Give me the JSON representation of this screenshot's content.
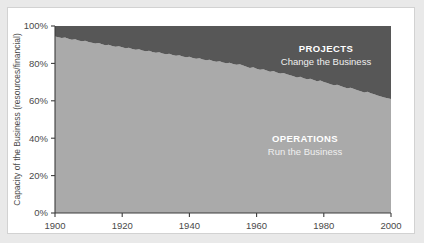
{
  "chart_data": {
    "type": "area",
    "stacked": true,
    "title": "",
    "xlabel": "",
    "ylabel": "Capacity of the Business (resources/financial)",
    "xlim": [
      1900,
      2000
    ],
    "ylim": [
      0,
      100
    ],
    "grid": false,
    "legend_position": "inside-bands",
    "x_tick_labels": [
      "1900",
      "1920",
      "1940",
      "1960",
      "1980",
      "2000"
    ],
    "x_ticks": [
      1900,
      1920,
      1940,
      1960,
      1980,
      2000
    ],
    "y_tick_labels": [
      "0%",
      "20%",
      "40%",
      "60%",
      "80%",
      "100%"
    ],
    "y_ticks": [
      0,
      20,
      40,
      60,
      80,
      100
    ],
    "x": [
      1900,
      1901,
      1902,
      1903,
      1904,
      1905,
      1906,
      1907,
      1908,
      1909,
      1910,
      1911,
      1912,
      1913,
      1914,
      1915,
      1916,
      1917,
      1918,
      1919,
      1920,
      1921,
      1922,
      1923,
      1924,
      1925,
      1926,
      1927,
      1928,
      1929,
      1930,
      1931,
      1932,
      1933,
      1934,
      1935,
      1936,
      1937,
      1938,
      1939,
      1940,
      1941,
      1942,
      1943,
      1944,
      1945,
      1946,
      1947,
      1948,
      1949,
      1950,
      1951,
      1952,
      1953,
      1954,
      1955,
      1956,
      1957,
      1958,
      1959,
      1960,
      1961,
      1962,
      1963,
      1964,
      1965,
      1966,
      1967,
      1968,
      1969,
      1970,
      1971,
      1972,
      1973,
      1974,
      1975,
      1976,
      1977,
      1978,
      1979,
      1980,
      1981,
      1982,
      1983,
      1984,
      1985,
      1986,
      1987,
      1988,
      1989,
      1990,
      1991,
      1992,
      1993,
      1994,
      1995,
      1996,
      1997,
      1998,
      1999,
      2000
    ],
    "series": [
      {
        "name": "OPERATIONS",
        "label": "OPERATIONS",
        "sublabel": "Run the Business",
        "color": "#aaaaaa",
        "values": [
          94.4,
          94.0,
          93.6,
          93.9,
          93.2,
          92.6,
          92.9,
          92.2,
          91.8,
          92.1,
          91.4,
          91.0,
          90.6,
          90.9,
          90.2,
          89.7,
          90.0,
          89.3,
          88.9,
          89.2,
          88.6,
          88.1,
          88.4,
          87.7,
          87.3,
          87.6,
          86.9,
          86.5,
          86.8,
          86.1,
          85.7,
          86.0,
          85.3,
          84.9,
          85.2,
          84.5,
          84.1,
          84.4,
          83.7,
          83.3,
          83.6,
          82.9,
          82.5,
          82.8,
          82.1,
          81.7,
          82.0,
          81.3,
          80.9,
          81.2,
          80.5,
          80.1,
          80.4,
          79.7,
          79.3,
          79.6,
          78.9,
          78.2,
          77.6,
          77.9,
          77.2,
          76.6,
          76.9,
          76.2,
          75.6,
          75.9,
          75.2,
          74.6,
          74.9,
          74.2,
          73.6,
          73.1,
          72.5,
          72.8,
          72.1,
          71.5,
          71.8,
          71.1,
          70.5,
          70.8,
          70.1,
          69.5,
          68.9,
          68.3,
          68.6,
          67.9,
          67.3,
          66.7,
          67.0,
          66.3,
          65.7,
          65.1,
          64.5,
          64.8,
          64.1,
          63.5,
          62.9,
          62.3,
          61.7,
          61.4,
          61.0
        ]
      },
      {
        "name": "PROJECTS",
        "label": "PROJECTS",
        "sublabel": "Change the Business",
        "color": "#575757",
        "values": [
          5.6,
          6.0,
          6.4,
          6.1,
          6.8,
          7.4,
          7.1,
          7.8,
          8.2,
          7.9,
          8.6,
          9.0,
          9.4,
          9.1,
          9.8,
          10.3,
          10.0,
          10.7,
          11.1,
          10.8,
          11.4,
          11.9,
          11.6,
          12.3,
          12.7,
          12.4,
          13.1,
          13.5,
          13.2,
          13.9,
          14.3,
          14.0,
          14.7,
          15.1,
          14.8,
          15.5,
          15.9,
          15.6,
          16.3,
          16.7,
          16.4,
          17.1,
          17.5,
          17.2,
          17.9,
          18.3,
          18.0,
          18.7,
          19.1,
          18.8,
          19.5,
          19.9,
          19.6,
          20.3,
          20.7,
          20.4,
          21.1,
          21.8,
          22.4,
          22.1,
          22.8,
          23.4,
          23.1,
          23.8,
          24.4,
          24.1,
          24.8,
          25.4,
          25.1,
          25.8,
          26.4,
          26.9,
          27.5,
          27.2,
          27.9,
          28.5,
          28.2,
          28.9,
          29.5,
          29.2,
          29.9,
          30.5,
          31.1,
          31.7,
          31.4,
          32.1,
          32.7,
          33.3,
          33.0,
          33.7,
          34.3,
          34.9,
          35.5,
          35.2,
          35.9,
          36.5,
          37.1,
          37.7,
          38.3,
          38.6,
          39.0
        ]
      }
    ]
  }
}
